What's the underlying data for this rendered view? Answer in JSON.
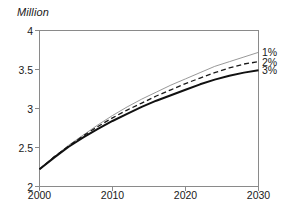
{
  "chart_data": {
    "type": "line",
    "title": "",
    "subtitle": "",
    "unit_label": "Million",
    "xlabel": "",
    "ylabel": "Million",
    "xlim": [
      2000,
      2030
    ],
    "ylim": [
      2,
      4
    ],
    "x_ticks": [
      "2000",
      "2010",
      "2020",
      "2030"
    ],
    "x_tick_values": [
      2000,
      2010,
      2020,
      2030
    ],
    "y_ticks": [
      "2",
      "2.5",
      "3",
      "3.5",
      "4"
    ],
    "y_tick_values": [
      2,
      2.5,
      3,
      3.5,
      4
    ],
    "grid": false,
    "legend_position": "right-end-of-line",
    "x": [
      2000,
      2002,
      2004,
      2006,
      2008,
      2010,
      2012,
      2014,
      2016,
      2018,
      2020,
      2022,
      2024,
      2026,
      2028,
      2030
    ],
    "series": [
      {
        "name": "1%",
        "label": "1%",
        "style": "thin-solid-gray",
        "color": "#8c8c8c",
        "width": 0.9,
        "dash": "none",
        "values": [
          2.22,
          2.38,
          2.53,
          2.66,
          2.79,
          2.91,
          3.02,
          3.12,
          3.21,
          3.3,
          3.38,
          3.46,
          3.54,
          3.6,
          3.66,
          3.72
        ]
      },
      {
        "name": "2%",
        "label": "2%",
        "style": "dashed-black",
        "color": "#1a1a1a",
        "width": 1.3,
        "dash": "5,3",
        "values": [
          2.22,
          2.38,
          2.52,
          2.65,
          2.77,
          2.88,
          2.98,
          3.07,
          3.16,
          3.24,
          3.32,
          3.39,
          3.46,
          3.52,
          3.57,
          3.6
        ]
      },
      {
        "name": "3%",
        "label": "3%",
        "style": "thick-solid-black",
        "color": "#111111",
        "width": 2.0,
        "dash": "none",
        "values": [
          2.22,
          2.37,
          2.51,
          2.63,
          2.74,
          2.84,
          2.93,
          3.02,
          3.1,
          3.17,
          3.24,
          3.31,
          3.37,
          3.42,
          3.46,
          3.49
        ]
      }
    ],
    "axis_color": "#8a8a8a",
    "frame": {
      "left_axis": true,
      "top_axis": true,
      "right_axis": true,
      "bottom_axis": true
    }
  }
}
